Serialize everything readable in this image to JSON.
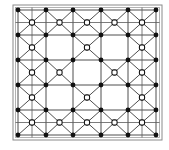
{
  "diagram": {
    "type": "lattice-grid",
    "grid_x": [
      18,
      46,
      73,
      101,
      128,
      156
    ],
    "grid_y": [
      10,
      35,
      60,
      85,
      110,
      135
    ],
    "border": {
      "outer": {
        "x": 13,
        "y": 5,
        "w": 149,
        "h": 135
      },
      "inner": {
        "x": 15.5,
        "y": 7.5,
        "w": 144,
        "h": 130
      }
    },
    "open_cells": [
      [
        1,
        1,
        1,
        1,
        1
      ],
      [
        1,
        0,
        1,
        0,
        1
      ],
      [
        1,
        1,
        0,
        1,
        1
      ],
      [
        1,
        0,
        1,
        0,
        1
      ],
      [
        1,
        1,
        1,
        1,
        1
      ]
    ],
    "extra_horizontal_rows": [
      0,
      4
    ],
    "extra_vertical_cols": [
      0,
      4
    ],
    "filled_node_count": 36,
    "open_node_count": 21,
    "colors": {
      "filled_node": "#111111",
      "open_node_fill": "#ffffff",
      "line": "#3a3a3a",
      "border": "#8a8a8a"
    }
  }
}
